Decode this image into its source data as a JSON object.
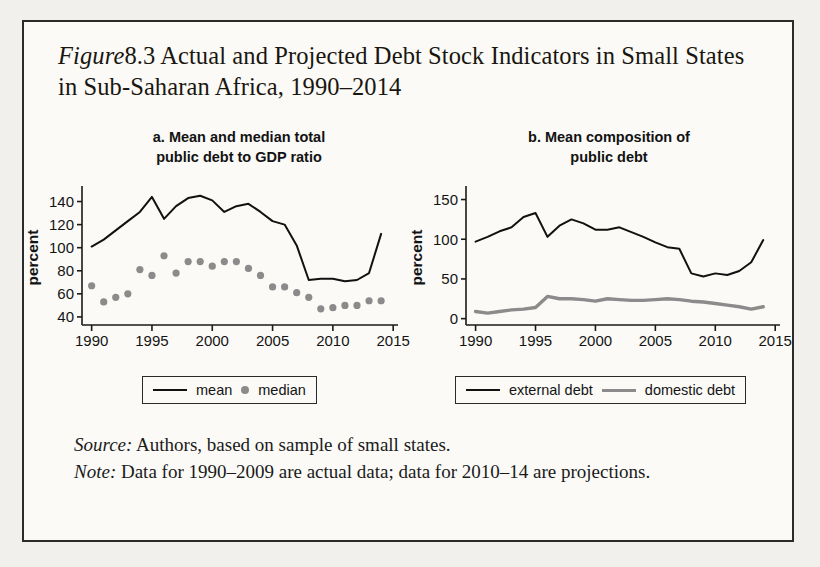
{
  "figure": {
    "label": "Figure 8.3",
    "label_prefix": "Figure",
    "label_number": "8.3",
    "title": "Actual and Projected Debt Stock Indicators in Small States in Sub-Saharan Africa, 1990–2014"
  },
  "notes": {
    "source_lead": "Source:",
    "source_text": "Authors, based on sample of small states.",
    "note_lead": "Note:",
    "note_text": "Data for 1990–2009 are actual data; data for 2010–14 are projections."
  },
  "colors": {
    "line_dark": "#111111",
    "line_gray": "#8b8b8b",
    "dot_gray": "#8b8b8b",
    "axis": "#1a1a1a",
    "page_background": "#fbfaf7",
    "frame": "#2b2b2b"
  },
  "chart_data": [
    {
      "type": "line",
      "panel": "a",
      "title": "a. Mean and median total public debt to GDP ratio",
      "title_line1": "a. Mean and median total",
      "title_line2": "public debt to GDP ratio",
      "xlabel": "",
      "ylabel": "percent",
      "xlim": [
        1989.2,
        2015.4
      ],
      "ylim": [
        33,
        150
      ],
      "xticks": [
        1990,
        1995,
        2000,
        2005,
        2010,
        2015
      ],
      "xtick_labels": [
        "1990",
        "1995",
        "2000",
        "2005",
        "2010",
        "2015"
      ],
      "yticks": [
        40,
        60,
        80,
        100,
        120,
        140
      ],
      "ytick_labels": [
        "40",
        "60",
        "80",
        "100",
        "120",
        "140"
      ],
      "grid": false,
      "legend_position": "below",
      "x": [
        1990,
        1991,
        1992,
        1993,
        1994,
        1995,
        1996,
        1997,
        1998,
        1999,
        2000,
        2001,
        2002,
        2003,
        2004,
        2005,
        2006,
        2007,
        2008,
        2009,
        2010,
        2011,
        2012,
        2013,
        2014
      ],
      "series": [
        {
          "name": "mean",
          "style": "line",
          "color": "#111111",
          "values": [
            101,
            107,
            115,
            123,
            131,
            144,
            125,
            136,
            143,
            145,
            141,
            131,
            136,
            138,
            131,
            123,
            120,
            102,
            72,
            73,
            73,
            71,
            72,
            78,
            112
          ]
        },
        {
          "name": "median",
          "style": "dots",
          "color": "#8b8b8b",
          "values": [
            67,
            53,
            57,
            60,
            81,
            76,
            93,
            78,
            88,
            88,
            84,
            88,
            88,
            82,
            76,
            66,
            66,
            61,
            57,
            47,
            48,
            50,
            50,
            54,
            54
          ]
        }
      ]
    },
    {
      "type": "line",
      "panel": "b",
      "title": "b. Mean composition of public debt",
      "title_line1": "b. Mean composition of",
      "title_line2": "public debt",
      "xlabel": "",
      "ylabel": "percent",
      "xlim": [
        1989.2,
        2015.4
      ],
      "ylim": [
        -8,
        162
      ],
      "xticks": [
        1990,
        1995,
        2000,
        2005,
        2010,
        2015
      ],
      "xtick_labels": [
        "1990",
        "1995",
        "2000",
        "2005",
        "2010",
        "2015"
      ],
      "yticks": [
        0,
        50,
        100,
        150
      ],
      "ytick_labels": [
        "0",
        "50",
        "100",
        "150"
      ],
      "grid": false,
      "legend_position": "below",
      "x": [
        1990,
        1991,
        1992,
        1993,
        1994,
        1995,
        1996,
        1997,
        1998,
        1999,
        2000,
        2001,
        2002,
        2003,
        2004,
        2005,
        2006,
        2007,
        2008,
        2009,
        2010,
        2011,
        2012,
        2013,
        2014
      ],
      "series": [
        {
          "name": "external debt",
          "style": "line",
          "color": "#111111",
          "values": [
            97,
            103,
            110,
            115,
            128,
            133,
            103,
            117,
            125,
            120,
            112,
            112,
            115,
            109,
            103,
            96,
            90,
            88,
            57,
            53,
            57,
            55,
            60,
            71,
            99
          ]
        },
        {
          "name": "domestic debt",
          "style": "line",
          "color": "#8b8b8b",
          "values": [
            9,
            7,
            9,
            11,
            12,
            14,
            28,
            25,
            25,
            24,
            22,
            25,
            24,
            23,
            23,
            24,
            25,
            24,
            22,
            21,
            19,
            17,
            15,
            12,
            15
          ]
        }
      ]
    }
  ],
  "panel_a": {
    "legend": [
      {
        "label": "mean",
        "marker": "line"
      },
      {
        "label": "median",
        "marker": "dot"
      }
    ]
  },
  "panel_b": {
    "legend": [
      {
        "label": "external debt",
        "marker": "line-dark"
      },
      {
        "label": "domestic debt",
        "marker": "line-gray"
      }
    ]
  }
}
